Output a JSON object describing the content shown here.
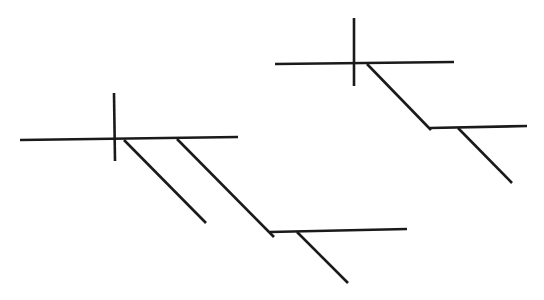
{
  "diagram": {
    "stroke_color": "#1a1a1a",
    "background": "#ffffff",
    "figures": [
      {
        "name": "left-figure",
        "lines": [
          {
            "role": "main-horizontal",
            "x1": 20,
            "y1": 140,
            "x2": 238,
            "y2": 137
          },
          {
            "role": "cross-vertical",
            "x1": 114,
            "y1": 93,
            "x2": 115,
            "y2": 161
          },
          {
            "role": "diagonal-short",
            "x1": 124,
            "y1": 140,
            "x2": 206,
            "y2": 223
          },
          {
            "role": "diagonal-long",
            "x1": 177,
            "y1": 139,
            "x2": 274,
            "y2": 237
          },
          {
            "role": "lower-horizontal",
            "x1": 270,
            "y1": 232,
            "x2": 407,
            "y2": 229
          },
          {
            "role": "lower-diagonal",
            "x1": 297,
            "y1": 232,
            "x2": 348,
            "y2": 283
          }
        ]
      },
      {
        "name": "right-figure",
        "lines": [
          {
            "role": "main-horizontal",
            "x1": 275,
            "y1": 64,
            "x2": 454,
            "y2": 62
          },
          {
            "role": "cross-vertical",
            "x1": 354,
            "y1": 18,
            "x2": 354,
            "y2": 86
          },
          {
            "role": "diagonal",
            "x1": 367,
            "y1": 64,
            "x2": 431,
            "y2": 130
          },
          {
            "role": "lower-horizontal",
            "x1": 430,
            "y1": 128,
            "x2": 527,
            "y2": 126
          },
          {
            "role": "lower-diagonal",
            "x1": 458,
            "y1": 128,
            "x2": 512,
            "y2": 183
          }
        ]
      }
    ]
  }
}
